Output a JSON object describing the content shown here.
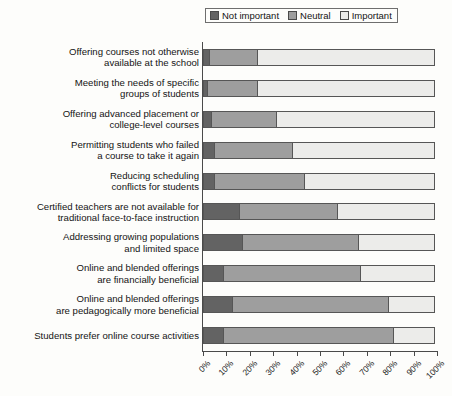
{
  "chart_data": {
    "type": "bar",
    "subtype": "stacked-horizontal-100",
    "title": "",
    "xlabel": "",
    "ylabel": "",
    "xlim": [
      0,
      100
    ],
    "xticks": [
      "0%",
      "10%",
      "20%",
      "30%",
      "40%",
      "50%",
      "60%",
      "70%",
      "80%",
      "90%",
      "100%"
    ],
    "grid": false,
    "legend_position": "top",
    "categories": [
      "Offering courses not otherwise\navailable at the school",
      "Meeting the needs of specific\ngroups of students",
      "Offering advanced placement or\ncollege-level courses",
      "Permitting students who failed\na course to take it again",
      "Reducing scheduling\nconflicts for students",
      "Certified teachers are not available for\ntraditional face-to-face instruction",
      "Addressing growing populations\nand limited space",
      "Online and blended offerings\nare financially beneficial",
      "Online and blended offerings\nare pedagogically more beneficial",
      "Students prefer online course activities"
    ],
    "series": [
      {
        "name": "Not important",
        "color": "#636363",
        "values": [
          3,
          2,
          4,
          5,
          5,
          16,
          17,
          9,
          13,
          9
        ]
      },
      {
        "name": "Neutral",
        "color": "#9e9e9e",
        "values": [
          21,
          22,
          28,
          34,
          39,
          42,
          50,
          59,
          67,
          73
        ]
      },
      {
        "name": "Important",
        "color": "#ececea",
        "values": [
          76,
          76,
          68,
          61,
          56,
          42,
          33,
          32,
          20,
          18
        ]
      }
    ]
  },
  "legend": {
    "items": [
      {
        "label": "Not important",
        "color": "#636363"
      },
      {
        "label": "Neutral",
        "color": "#9e9e9e"
      },
      {
        "label": "Important",
        "color": "#ececea"
      }
    ]
  }
}
